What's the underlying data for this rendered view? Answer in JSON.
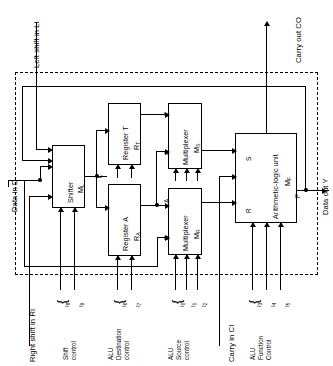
{
  "figure": {
    "orientation": "rotated-90-ccw",
    "boundary_style": "dashed"
  },
  "blocks": [
    {
      "id": "shifter",
      "name": "Shifter",
      "symbol": "M",
      "subscript": "L"
    },
    {
      "id": "reg_t",
      "name": "Register T",
      "symbol": "R",
      "subscript": "T"
    },
    {
      "id": "reg_a",
      "name": "Register A",
      "symbol": "R",
      "subscript": "A"
    },
    {
      "id": "mux_s",
      "name": "Multiplexer",
      "symbol": "M",
      "subscript": "S"
    },
    {
      "id": "mux_r",
      "name": "Multiplexer",
      "symbol": "M",
      "subscript": "R"
    },
    {
      "id": "alu",
      "name": "Arithmetic-logic unit",
      "symbol": "M",
      "subscript": "F"
    }
  ],
  "external_ports": {
    "left_shift_in": "Left shift in LI",
    "carry_out": "Carry out CO",
    "data_in": "Data in D",
    "data_out": "Data out Y",
    "right_shift_in": "Right shift in RI",
    "carry_in": "Carry in CI"
  },
  "signal_labels": {
    "shifter_out": "L",
    "reg_t_out": "T",
    "reg_a_out": "A",
    "mux_r_in_a": "A",
    "mux_r_in_d": "D",
    "alu_in_s": "S",
    "alu_in_r": "R",
    "alu_out": "F"
  },
  "control_groups": [
    {
      "id": "shift_control",
      "label": "Shift\ncontrol",
      "line1": "Shift",
      "line2": "control",
      "line3": "",
      "bits": [
        "I8",
        "I9"
      ]
    },
    {
      "id": "alu_destination",
      "label": "ALU Destination control",
      "line1": "ALU",
      "line2": "Destination",
      "line3": "control",
      "bits": [
        "I6",
        "I7"
      ]
    },
    {
      "id": "alu_source",
      "label": "ALU Source control",
      "line1": "ALU",
      "line2": "Source",
      "line3": "control",
      "bits": [
        "I0",
        "I1",
        "I2"
      ]
    },
    {
      "id": "alu_function",
      "label": "ALU Function Control",
      "line1": "ALU",
      "line2": "Function",
      "line3": "Control",
      "bits": [
        "I3",
        "I4",
        "I5"
      ]
    }
  ],
  "bit_indices": {
    "i0": "0",
    "i1": "1",
    "i2": "2",
    "i3": "3",
    "i4": "4",
    "i5": "5",
    "i6": "6",
    "i7": "7",
    "i8": "8",
    "i9": "9"
  },
  "letters": {
    "I": "I"
  },
  "colors": {
    "line": "#000000",
    "background": "#ffffff"
  }
}
